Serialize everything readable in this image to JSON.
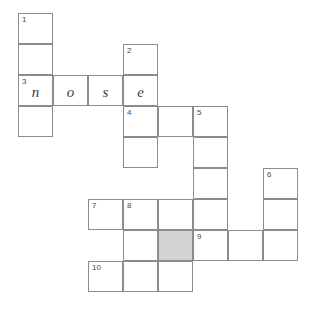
{
  "puzzle": {
    "type": "crossword-grid",
    "cell_width": 35,
    "cell_height": 31,
    "origin_x": 18,
    "origin_y": 13,
    "colors": {
      "background": "#ffffff",
      "cell_fill": "#ffffff",
      "cell_border": "#8c8c8c",
      "shaded_fill": "#d4d4d4",
      "number_text": "#4a4a4a",
      "letter_text": "#3c3c3c"
    },
    "clue_numbers": [
      "1",
      "2",
      "3",
      "4",
      "5",
      "6",
      "7",
      "8",
      "9",
      "10"
    ],
    "filled_answers": [
      {
        "number": "3",
        "direction": "across",
        "text": "nose"
      }
    ],
    "cells": [
      {
        "col": 0,
        "row": 0,
        "number": "1",
        "letter": "",
        "shaded": false
      },
      {
        "col": 0,
        "row": 1,
        "number": "",
        "letter": "",
        "shaded": false
      },
      {
        "col": 0,
        "row": 2,
        "number": "3",
        "letter": "n",
        "shaded": false
      },
      {
        "col": 0,
        "row": 3,
        "number": "",
        "letter": "",
        "shaded": false
      },
      {
        "col": 1,
        "row": 2,
        "number": "",
        "letter": "o",
        "shaded": false
      },
      {
        "col": 2,
        "row": 2,
        "number": "",
        "letter": "s",
        "shaded": false
      },
      {
        "col": 3,
        "row": 1,
        "number": "2",
        "letter": "",
        "shaded": false
      },
      {
        "col": 3,
        "row": 2,
        "number": "",
        "letter": "e",
        "shaded": false
      },
      {
        "col": 3,
        "row": 3,
        "number": "4",
        "letter": "",
        "shaded": false
      },
      {
        "col": 3,
        "row": 4,
        "number": "",
        "letter": "",
        "shaded": false
      },
      {
        "col": 4,
        "row": 3,
        "number": "",
        "letter": "",
        "shaded": false
      },
      {
        "col": 5,
        "row": 3,
        "number": "5",
        "letter": "",
        "shaded": false
      },
      {
        "col": 5,
        "row": 4,
        "number": "",
        "letter": "",
        "shaded": false
      },
      {
        "col": 5,
        "row": 5,
        "number": "",
        "letter": "",
        "shaded": false
      },
      {
        "col": 5,
        "row": 6,
        "number": "",
        "letter": "",
        "shaded": false
      },
      {
        "col": 7,
        "row": 5,
        "number": "6",
        "letter": "",
        "shaded": false
      },
      {
        "col": 7,
        "row": 6,
        "number": "",
        "letter": "",
        "shaded": false
      },
      {
        "col": 7,
        "row": 7,
        "number": "",
        "letter": "",
        "shaded": false
      },
      {
        "col": 2,
        "row": 6,
        "number": "7",
        "letter": "",
        "shaded": false
      },
      {
        "col": 3,
        "row": 6,
        "number": "8",
        "letter": "",
        "shaded": false
      },
      {
        "col": 4,
        "row": 6,
        "number": "",
        "letter": "",
        "shaded": false
      },
      {
        "col": 3,
        "row": 7,
        "number": "",
        "letter": "",
        "shaded": false
      },
      {
        "col": 4,
        "row": 7,
        "number": "",
        "letter": "",
        "shaded": true
      },
      {
        "col": 5,
        "row": 7,
        "number": "9",
        "letter": "",
        "shaded": false
      },
      {
        "col": 6,
        "row": 7,
        "number": "",
        "letter": "",
        "shaded": false
      },
      {
        "col": 2,
        "row": 8,
        "number": "10",
        "letter": "",
        "shaded": false
      },
      {
        "col": 3,
        "row": 8,
        "number": "",
        "letter": "",
        "shaded": false
      },
      {
        "col": 4,
        "row": 8,
        "number": "",
        "letter": "",
        "shaded": false
      }
    ]
  }
}
